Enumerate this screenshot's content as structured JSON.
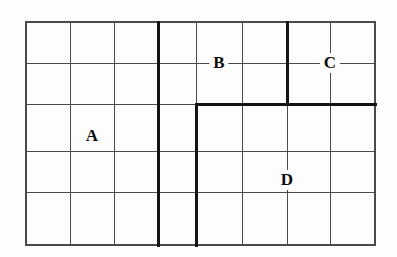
{
  "figure": {
    "type": "grid-region-diagram",
    "background_color": "#fdfdfd",
    "thin_line_color": "#4a4a4a",
    "thick_line_color": "#141414",
    "label_color": "#0d0d0d",
    "thin_line_width": 1,
    "thick_line_width": 3,
    "grid": {
      "columns": 8,
      "rows": 5,
      "x_positions": [
        26,
        70,
        114,
        158,
        196,
        242,
        287,
        330,
        375
      ],
      "y_positions": [
        22,
        63,
        104,
        151,
        192,
        245
      ],
      "left": 26,
      "top": 22,
      "right": 375,
      "bottom": 245,
      "width": 349,
      "height": 223
    },
    "thick_segments": [
      {
        "name": "vertical-divider-left",
        "orientation": "vertical",
        "x": 158,
        "y1": 22,
        "y2": 245
      },
      {
        "name": "vertical-divider-region-d-left",
        "orientation": "vertical",
        "x": 196,
        "y1": 104,
        "y2": 245
      },
      {
        "name": "vertical-divider-b-c",
        "orientation": "vertical",
        "x": 287,
        "y1": 22,
        "y2": 104
      },
      {
        "name": "horizontal-divider-bc-d",
        "orientation": "horizontal",
        "y": 104,
        "x1": 196,
        "x2": 375
      }
    ],
    "border": {
      "name": "outer-border",
      "x": 26,
      "y": 22,
      "width": 349,
      "height": 223
    },
    "labels": [
      {
        "id": "A",
        "text": "A",
        "x": 92,
        "y": 136
      },
      {
        "id": "B",
        "text": "B",
        "x": 219,
        "y": 63
      },
      {
        "id": "C",
        "text": "C",
        "x": 330,
        "y": 63
      },
      {
        "id": "D",
        "text": "D",
        "x": 287,
        "y": 180
      }
    ]
  }
}
